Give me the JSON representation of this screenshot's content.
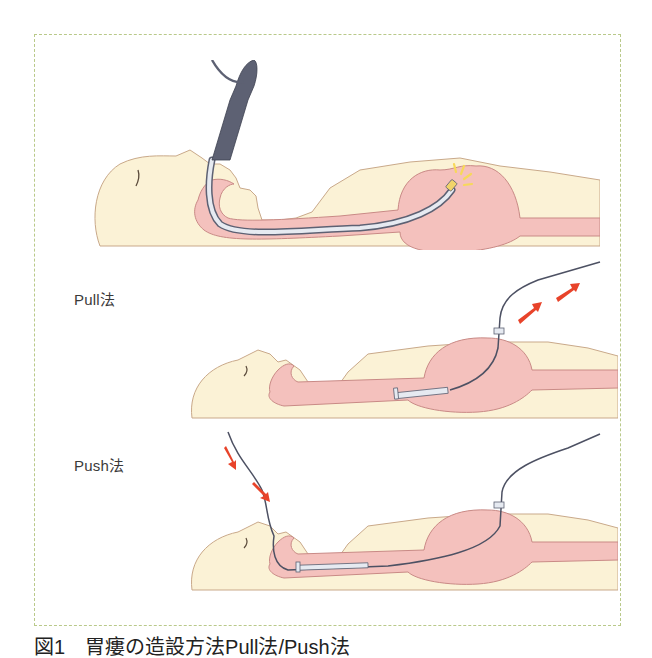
{
  "figure": {
    "panels": [
      {
        "id": "insertion",
        "label": ""
      },
      {
        "id": "pull",
        "label": "Pull法"
      },
      {
        "id": "push",
        "label": "Push法"
      }
    ],
    "caption": "図1　胃瘻の造設方法Pull法/Push法"
  },
  "colors": {
    "frame_border": "#b9c98a",
    "skin": "#fbf2d6",
    "skin_outline": "#c9a98a",
    "organ": "#f4c1bd",
    "organ_outline": "#c98a86",
    "scope": "#5d6173",
    "tube_fill": "#e6eaf1",
    "arrow": "#e8432a",
    "light": "#f7d85a"
  }
}
